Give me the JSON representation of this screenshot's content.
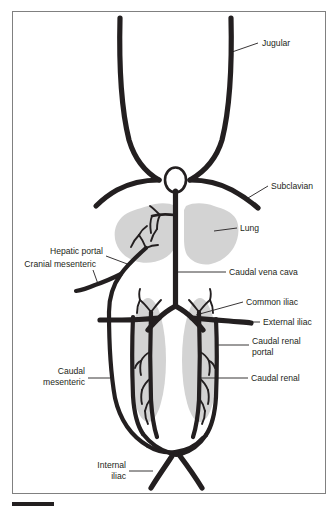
{
  "figure": {
    "background_color": "#ffffff",
    "frame_color": "#808080",
    "vessel_color": "#231f20",
    "organ_shade_color": "#d3d3d3"
  },
  "labels": {
    "jugular": "Jugular",
    "subclavian": "Subclavian",
    "lung": "Lung",
    "caudal_vena_cava": "Caudal vena cava",
    "common_iliac": "Common iliac",
    "external_iliac": "External iliac",
    "caudal_renal_portal_line1": "Caudal renal",
    "caudal_renal_portal_line2": "portal",
    "caudal_renal": "Caudal renal",
    "hepatic_portal": "Hepatic portal",
    "cranial_mesenteric": "Cranial mesenteric",
    "caudal_mesenteric_line1": "Caudal",
    "caudal_mesenteric_line2": "mesenteric",
    "internal_iliac_line1": "Internal",
    "internal_iliac_line2": "iliac"
  },
  "organs": {
    "lung_left": "lung-left-shade",
    "lung_right": "lung-right-shade",
    "kidney_left": "kidney-left-shade",
    "kidney_right": "kidney-right-shade",
    "heart": "heart-shape"
  },
  "scale_bar": {
    "present": true,
    "label": ""
  }
}
